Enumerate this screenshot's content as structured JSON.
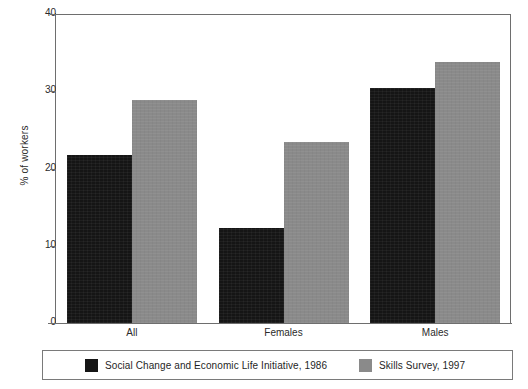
{
  "chart_data": {
    "type": "bar",
    "title": "",
    "xlabel": "",
    "ylabel": "% of workers",
    "categories": [
      "All",
      "Females",
      "Males"
    ],
    "series": [
      {
        "name": "Social Change and Economic Life Initiative, 1986",
        "color": "#151515",
        "values": [
          21.7,
          12.3,
          30.4
        ]
      },
      {
        "name": "Skills Survey, 1997",
        "color": "#8a8a8a",
        "values": [
          28.9,
          23.4,
          33.8
        ]
      }
    ],
    "ylim": [
      0,
      40
    ],
    "yticks": [
      0,
      10,
      20,
      30,
      40
    ],
    "ytick_labels": [
      "0",
      "10",
      "20",
      "30",
      "40"
    ],
    "grid": false,
    "legend_position": "bottom",
    "bar_grouping": "grouped"
  },
  "legend": {
    "items": [
      {
        "label": "Social Change and Economic Life Initiative, 1986",
        "swatch": "black-swatch"
      },
      {
        "label": "Skills Survey, 1997",
        "swatch": "gray-swatch"
      }
    ]
  }
}
